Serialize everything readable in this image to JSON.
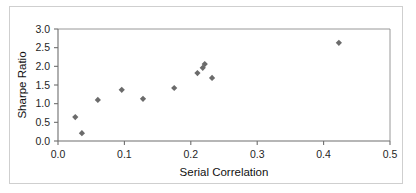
{
  "chart_data": {
    "type": "scatter",
    "title": "",
    "xlabel": "Serial Correlation",
    "ylabel": "Sharpe Ratio",
    "xlim": [
      0.0,
      0.5
    ],
    "ylim": [
      0.0,
      3.0
    ],
    "xticks": [
      0.0,
      0.1,
      0.2,
      0.3,
      0.4,
      0.5
    ],
    "xticklabels": [
      "0.0",
      "0.1",
      "0.2",
      "0.3",
      "0.4",
      "0.5"
    ],
    "yticks": [
      0.0,
      0.5,
      1.0,
      1.5,
      2.0,
      2.5,
      3.0
    ],
    "yticklabels": [
      "0.0",
      "0.5",
      "1.0",
      "1.5",
      "2.0",
      "2.5",
      "3.0"
    ],
    "grid": false,
    "legend": false,
    "marker_color": "#6b6b6b",
    "marker_shape": "diamond",
    "series": [
      {
        "name": "Funds",
        "points": [
          {
            "x": 0.026,
            "y": 0.64
          },
          {
            "x": 0.036,
            "y": 0.21
          },
          {
            "x": 0.06,
            "y": 1.1
          },
          {
            "x": 0.096,
            "y": 1.37
          },
          {
            "x": 0.128,
            "y": 1.13
          },
          {
            "x": 0.175,
            "y": 1.42
          },
          {
            "x": 0.21,
            "y": 1.82
          },
          {
            "x": 0.218,
            "y": 1.96
          },
          {
            "x": 0.221,
            "y": 2.06
          },
          {
            "x": 0.232,
            "y": 1.69
          },
          {
            "x": 0.423,
            "y": 2.63
          }
        ]
      }
    ]
  },
  "figure": {
    "xlabel": "Serial Correlation",
    "ylabel": "Sharpe Ratio"
  }
}
